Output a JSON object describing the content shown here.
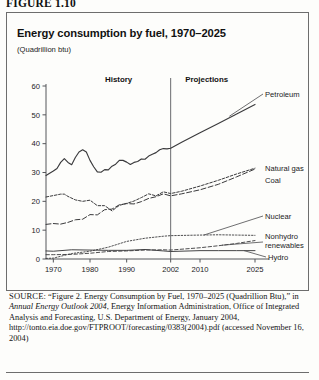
{
  "figure_label": "FIGURE 1.10",
  "chart": {
    "title": "Energy consumption by fuel, 1970–2025",
    "units": "(Quadrillion btu)",
    "period_history": "History",
    "period_projections": "Projections"
  },
  "labels": {
    "petroleum": "Petroleum",
    "natural_gas": "Natural gas",
    "coal": "Coal",
    "nuclear": "Nuclear",
    "nonhydro1": "Nonhydro",
    "nonhydro2": "renewables",
    "hydro": "Hydro"
  },
  "source": {
    "prefix": "SOURCE:",
    "part1": " “Figure 2. Energy Consumption by Fuel, 1970–2025 (Quadrillion Btu),” in ",
    "italic": "Annual Energy Outlook 2004",
    "part2": ", Energy Information Administration, Office of Integrated Analysis and Forecasting, U.S. Department of Energy, January 2004, http://tonto.eia.doe.gov/FTPROOT/forecasting/0383(2004).pdf (accessed November 16, 2004)"
  },
  "chart_data": {
    "type": "line",
    "title": "Energy consumption by fuel, 1970–2025",
    "xlabel": "",
    "ylabel": "Quadrillion btu",
    "xlim": [
      1968,
      2025
    ],
    "ylim": [
      0,
      60
    ],
    "yticks": [
      0,
      10,
      20,
      30,
      40,
      50,
      60
    ],
    "xticks": [
      1970,
      1980,
      1990,
      2002,
      2010,
      2025
    ],
    "grid": false,
    "legend": "right-inline-labels",
    "history_projection_divider": 2002,
    "series": [
      {
        "name": "Petroleum",
        "style": "solid",
        "x": [
          1968,
          1970,
          1971,
          1972,
          1973,
          1974,
          1975,
          1976,
          1977,
          1978,
          1979,
          1980,
          1981,
          1982,
          1983,
          1984,
          1985,
          1986,
          1987,
          1988,
          1989,
          1990,
          1991,
          1992,
          1993,
          1994,
          1995,
          1996,
          1997,
          1998,
          1999,
          2000,
          2001,
          2002,
          2005,
          2010,
          2015,
          2020,
          2025
        ],
        "y": [
          29.0,
          30.5,
          31.4,
          33.5,
          34.8,
          33.5,
          32.7,
          35.2,
          37.1,
          37.9,
          37.1,
          34.2,
          32.0,
          30.2,
          30.1,
          31.0,
          30.9,
          32.2,
          32.9,
          34.2,
          34.2,
          33.6,
          32.8,
          33.5,
          33.8,
          34.7,
          34.6,
          35.7,
          36.3,
          36.9,
          37.9,
          38.3,
          38.2,
          38.4,
          40.5,
          43.8,
          47.0,
          50.3,
          53.6
        ]
      },
      {
        "name": "Natural gas",
        "style": "dotted",
        "x": [
          1968,
          1970,
          1972,
          1973,
          1974,
          1976,
          1978,
          1980,
          1982,
          1984,
          1986,
          1988,
          1990,
          1992,
          1994,
          1996,
          1998,
          2000,
          2002,
          2005,
          2010,
          2015,
          2020,
          2025
        ],
        "y": [
          21.5,
          22.0,
          22.5,
          22.5,
          21.7,
          20.5,
          20.0,
          20.4,
          18.5,
          18.5,
          16.7,
          18.6,
          19.3,
          20.1,
          21.3,
          22.6,
          21.9,
          23.3,
          22.7,
          23.5,
          25.3,
          27.3,
          29.5,
          31.5
        ]
      },
      {
        "name": "Coal",
        "style": "dashed",
        "x": [
          1968,
          1970,
          1972,
          1974,
          1976,
          1978,
          1980,
          1982,
          1984,
          1986,
          1988,
          1990,
          1992,
          1994,
          1996,
          1998,
          2000,
          2002,
          2005,
          2010,
          2015,
          2020,
          2025
        ],
        "y": [
          12.0,
          12.3,
          12.1,
          12.7,
          13.6,
          13.8,
          15.4,
          15.3,
          17.1,
          17.3,
          18.8,
          19.2,
          19.1,
          19.9,
          21.0,
          21.6,
          22.6,
          21.9,
          22.6,
          24.0,
          25.9,
          28.5,
          31.2
        ]
      },
      {
        "name": "Nuclear",
        "style": "dotted-fine",
        "x": [
          1968,
          1970,
          1975,
          1980,
          1985,
          1990,
          1995,
          2000,
          2002,
          2010,
          2015,
          2020,
          2025
        ],
        "y": [
          0.2,
          0.3,
          1.9,
          2.7,
          4.1,
          6.1,
          7.2,
          7.9,
          8.1,
          8.3,
          8.4,
          8.3,
          8.2
        ]
      },
      {
        "name": "Nonhydro renewables",
        "style": "dashed-fine",
        "x": [
          1968,
          1970,
          1975,
          1980,
          1985,
          1990,
          1995,
          2000,
          2002,
          2010,
          2015,
          2020,
          2025
        ],
        "y": [
          1.5,
          1.5,
          1.6,
          2.0,
          2.6,
          2.8,
          3.1,
          3.2,
          3.1,
          3.9,
          4.6,
          5.4,
          6.4
        ]
      },
      {
        "name": "Hydro",
        "style": "solid-thin",
        "x": [
          1968,
          1970,
          1975,
          1980,
          1985,
          1990,
          1995,
          2000,
          2002,
          2010,
          2015,
          2020,
          2025
        ],
        "y": [
          2.8,
          2.7,
          3.2,
          3.1,
          3.0,
          3.0,
          3.3,
          2.8,
          2.6,
          2.9,
          2.9,
          2.9,
          2.9
        ]
      }
    ]
  }
}
